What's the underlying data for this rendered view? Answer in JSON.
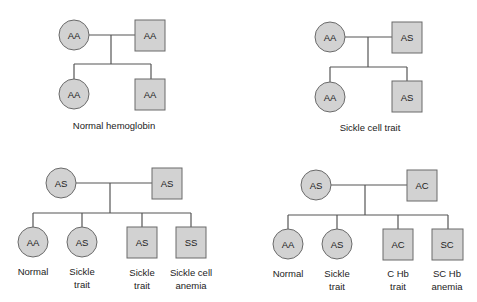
{
  "panels": [
    {
      "id": "normal-hemoglobin",
      "caption": "Normal hemoglobin",
      "parents": [
        {
          "sex": "female",
          "genotype": "AA"
        },
        {
          "sex": "male",
          "genotype": "AA"
        }
      ],
      "children": [
        {
          "sex": "female",
          "genotype": "AA",
          "label": []
        },
        {
          "sex": "male",
          "genotype": "AA",
          "label": []
        }
      ]
    },
    {
      "id": "sickle-cell-trait",
      "caption": "Sickle cell trait",
      "parents": [
        {
          "sex": "female",
          "genotype": "AA"
        },
        {
          "sex": "male",
          "genotype": "AS"
        }
      ],
      "children": [
        {
          "sex": "female",
          "genotype": "AA",
          "label": []
        },
        {
          "sex": "male",
          "genotype": "AS",
          "label": []
        }
      ]
    },
    {
      "id": "as-x-as",
      "caption": "",
      "parents": [
        {
          "sex": "female",
          "genotype": "AS"
        },
        {
          "sex": "male",
          "genotype": "AS"
        }
      ],
      "children": [
        {
          "sex": "female",
          "genotype": "AA",
          "label": [
            "Normal"
          ]
        },
        {
          "sex": "female",
          "genotype": "AS",
          "label": [
            "Sickle",
            "trait"
          ]
        },
        {
          "sex": "male",
          "genotype": "AS",
          "label": [
            "Sickle",
            "trait"
          ]
        },
        {
          "sex": "male",
          "genotype": "SS",
          "label": [
            "Sickle cell",
            "anemia"
          ]
        }
      ]
    },
    {
      "id": "as-x-ac",
      "caption": "",
      "parents": [
        {
          "sex": "female",
          "genotype": "AS"
        },
        {
          "sex": "male",
          "genotype": "AC"
        }
      ],
      "children": [
        {
          "sex": "female",
          "genotype": "AA",
          "label": [
            "Normal"
          ]
        },
        {
          "sex": "female",
          "genotype": "AS",
          "label": [
            "Sickle",
            "trait"
          ]
        },
        {
          "sex": "male",
          "genotype": "AC",
          "label": [
            "C Hb",
            "trait"
          ]
        },
        {
          "sex": "male",
          "genotype": "SC",
          "label": [
            "SC Hb",
            "anemia"
          ]
        }
      ]
    }
  ],
  "colors": {
    "fill": "#d2d2d2",
    "stroke": "#6a6a6a",
    "line": "#555555"
  }
}
